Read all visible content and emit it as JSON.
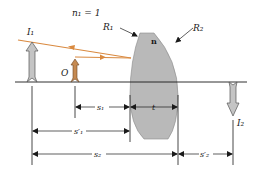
{
  "diagram": {
    "medium_label": "n₁ = 1",
    "lens_index_label": "n",
    "surface_labels": {
      "first": "R₁",
      "second": "R₂"
    },
    "object_label": "O",
    "image_labels": {
      "first": "I₁",
      "second": "I₂"
    },
    "dimension_labels": {
      "s1": "s₁",
      "t": "t",
      "s1_prime": "s′₁",
      "s2": "s₂",
      "s2_prime": "s′₂"
    },
    "colors": {
      "ray": "#d9893f",
      "lens_fill": "#b9b9b9",
      "image_arrow_fill": "#c4c4c4",
      "object_arrow_fill": "#c58a52",
      "line": "#1a1a1a"
    }
  }
}
